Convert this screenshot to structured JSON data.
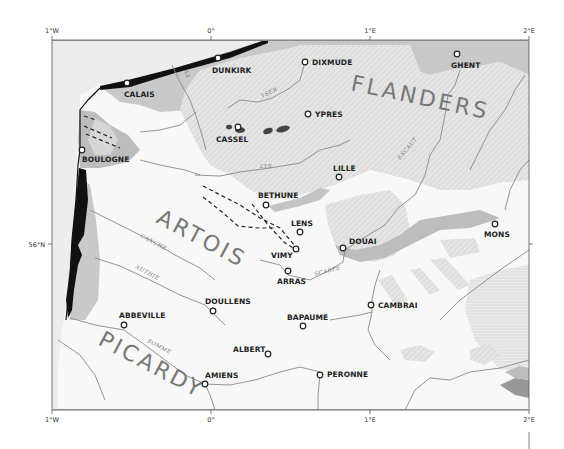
{
  "map": {
    "frame": {
      "x": 52,
      "y": 40,
      "width": 477,
      "height": 370
    },
    "colors": {
      "lowland_white": "#f7f7f7",
      "sea_light": "#f2f2f2",
      "plain_grey": "#c8c8c8",
      "hatched_bg": "#e2e2e2",
      "hatch_stroke": "#ffffff",
      "coast_black": "#111111",
      "river": "#8a8a8a",
      "dark_patch": "#9a9a9a"
    },
    "longitude_ticks": [
      {
        "label": "1°W",
        "x": 52
      },
      {
        "label": "0°",
        "x": 211
      },
      {
        "label": "1°E",
        "x": 370
      },
      {
        "label": "2°E",
        "x": 529
      }
    ],
    "latitude_ticks": [
      {
        "label": "56°N",
        "y": 244
      }
    ],
    "regions": [
      {
        "name": "FLANDERS",
        "x": 350,
        "y": 90,
        "rotate": 12
      },
      {
        "name": "ARTOIS",
        "x": 155,
        "y": 222,
        "rotate": 28
      },
      {
        "name": "PICARDY",
        "x": 97,
        "y": 344,
        "rotate": 28
      }
    ],
    "rivers": [
      {
        "name": "AA",
        "x": 184,
        "y": 70,
        "rotate": 75
      },
      {
        "name": "YSER",
        "x": 262,
        "y": 98,
        "rotate": -25
      },
      {
        "name": "LYS",
        "x": 260,
        "y": 168,
        "rotate": 0
      },
      {
        "name": "ESCAUT",
        "x": 400,
        "y": 160,
        "rotate": -50
      },
      {
        "name": "CANCHE",
        "x": 140,
        "y": 237,
        "rotate": 28
      },
      {
        "name": "AUTHIE",
        "x": 135,
        "y": 268,
        "rotate": 28
      },
      {
        "name": "SCARPE",
        "x": 315,
        "y": 276,
        "rotate": -15
      },
      {
        "name": "SOMME",
        "x": 147,
        "y": 342,
        "rotate": 28
      }
    ],
    "towns": [
      {
        "name": "CALAIS",
        "x": 127,
        "y": 83,
        "lx": 124,
        "ly": 97,
        "anchor": "start"
      },
      {
        "name": "DUNKIRK",
        "x": 218,
        "y": 58,
        "lx": 212,
        "ly": 73,
        "anchor": "start"
      },
      {
        "name": "DIXMUDE",
        "x": 305,
        "y": 62,
        "lx": 312,
        "ly": 65,
        "anchor": "start"
      },
      {
        "name": "GHENT",
        "x": 457,
        "y": 54,
        "lx": 451,
        "ly": 68,
        "anchor": "start"
      },
      {
        "name": "YPRES",
        "x": 308,
        "y": 114,
        "lx": 315,
        "ly": 117,
        "anchor": "start"
      },
      {
        "name": "CASSEL",
        "x": 238,
        "y": 127,
        "lx": 216,
        "ly": 142,
        "anchor": "start"
      },
      {
        "name": "BOULOGNE",
        "x": 82,
        "y": 150,
        "lx": 82,
        "ly": 162,
        "anchor": "start"
      },
      {
        "name": "LILLE",
        "x": 339,
        "y": 177,
        "lx": 333,
        "ly": 171,
        "anchor": "start"
      },
      {
        "name": "BETHUNE",
        "x": 266,
        "y": 205,
        "lx": 258,
        "ly": 198,
        "anchor": "start"
      },
      {
        "name": "LENS",
        "x": 300,
        "y": 232,
        "lx": 291,
        "ly": 226,
        "anchor": "start"
      },
      {
        "name": "VIMY",
        "x": 296,
        "y": 249,
        "lx": 271,
        "ly": 258,
        "anchor": "start"
      },
      {
        "name": "DOUAI",
        "x": 343,
        "y": 248,
        "lx": 349,
        "ly": 244,
        "anchor": "start"
      },
      {
        "name": "MONS",
        "x": 495,
        "y": 224,
        "lx": 484,
        "ly": 237,
        "anchor": "start"
      },
      {
        "name": "ARRAS",
        "x": 288,
        "y": 271,
        "lx": 277,
        "ly": 284,
        "anchor": "start"
      },
      {
        "name": "CAMBRAI",
        "x": 371,
        "y": 305,
        "lx": 378,
        "ly": 308,
        "anchor": "start"
      },
      {
        "name": "DOULLENS",
        "x": 213,
        "y": 311,
        "lx": 205,
        "ly": 304,
        "anchor": "start"
      },
      {
        "name": "ABBEVILLE",
        "x": 124,
        "y": 325,
        "lx": 119,
        "ly": 318,
        "anchor": "start"
      },
      {
        "name": "BAPAUME",
        "x": 303,
        "y": 326,
        "lx": 287,
        "ly": 320,
        "anchor": "start"
      },
      {
        "name": "ALBERT",
        "x": 268,
        "y": 354,
        "lx": 233,
        "ly": 352,
        "anchor": "start"
      },
      {
        "name": "AMIENS",
        "x": 205,
        "y": 384,
        "lx": 205,
        "ly": 378,
        "anchor": "start"
      },
      {
        "name": "PERONNE",
        "x": 320,
        "y": 375,
        "lx": 327,
        "ly": 377,
        "anchor": "start"
      }
    ]
  }
}
